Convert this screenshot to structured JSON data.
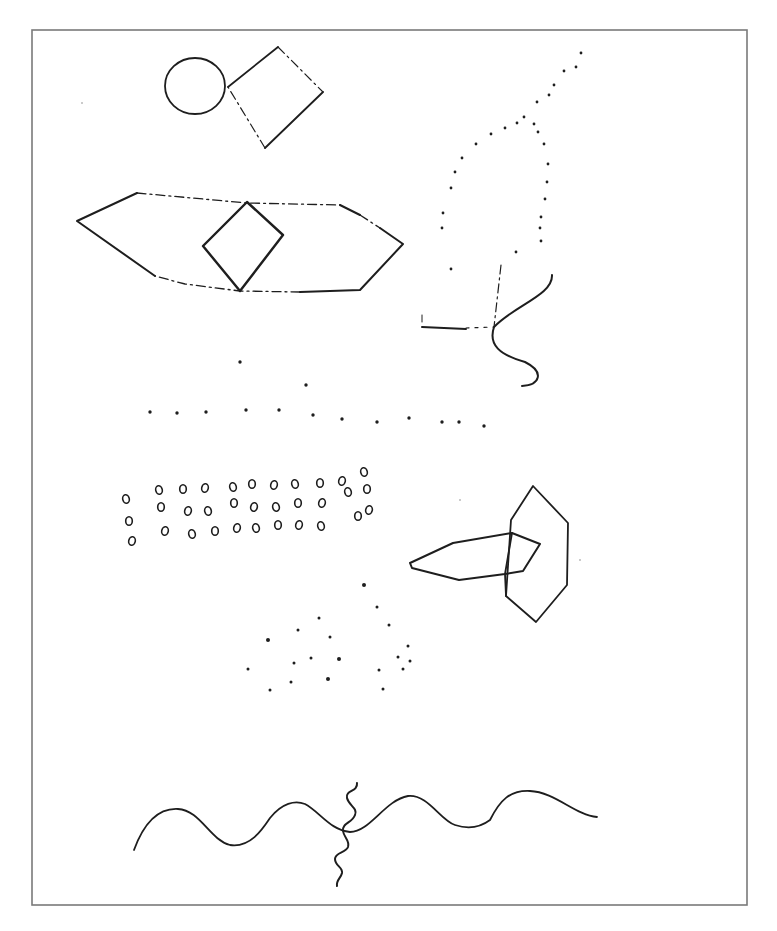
{
  "page": {
    "width": 777,
    "height": 931,
    "background": "#ffffff",
    "ink": "#1e1e1e",
    "frame_color": "#7a7a7a"
  },
  "frame": {
    "x": 32,
    "y": 30,
    "width": 715,
    "height": 875
  },
  "figures": {
    "circle": {
      "cx": 195,
      "cy": 86,
      "rx": 30,
      "ry": 28
    },
    "top_diamond": {
      "points": [
        [
          228,
          87
        ],
        [
          278,
          47
        ],
        [
          323,
          92
        ],
        [
          265,
          148
        ]
      ],
      "dashed_edges": [
        1,
        3
      ]
    },
    "hexagon": {
      "solid_paths": [
        [
          [
            155,
            276
          ],
          [
            77,
            221
          ],
          [
            137,
            193
          ]
        ],
        [
          [
            340,
            205
          ],
          [
            360,
            215
          ]
        ],
        [
          [
            380,
            228
          ],
          [
            403,
            244
          ],
          [
            360,
            290
          ],
          [
            300,
            292
          ]
        ]
      ],
      "dashed_paths": [
        [
          [
            137,
            193
          ],
          [
            247,
            203
          ],
          [
            340,
            205
          ]
        ],
        [
          [
            360,
            215
          ],
          [
            380,
            228
          ]
        ],
        [
          [
            300,
            292
          ],
          [
            240,
            291
          ],
          [
            185,
            284
          ],
          [
            155,
            276
          ]
        ]
      ]
    },
    "inner_diamond": {
      "points": [
        [
          247,
          202
        ],
        [
          283,
          235
        ],
        [
          240,
          291
        ],
        [
          203,
          246
        ]
      ]
    },
    "dotted_arch": {
      "dots": [
        [
          581,
          53
        ],
        [
          576,
          67
        ],
        [
          564,
          71
        ],
        [
          554,
          85
        ],
        [
          549,
          95
        ],
        [
          537,
          102
        ],
        [
          524,
          117
        ],
        [
          517,
          123
        ],
        [
          505,
          128
        ],
        [
          491,
          134
        ],
        [
          476,
          144
        ],
        [
          462,
          158
        ],
        [
          455,
          172
        ],
        [
          451,
          188
        ],
        [
          443,
          213
        ],
        [
          442,
          228
        ],
        [
          451,
          269
        ],
        [
          534,
          124
        ],
        [
          538,
          132
        ],
        [
          544,
          144
        ],
        [
          548,
          164
        ],
        [
          547,
          182
        ],
        [
          545,
          199
        ],
        [
          541,
          217
        ],
        [
          540,
          228
        ],
        [
          541,
          241
        ],
        [
          516,
          252
        ]
      ]
    },
    "corner_shape": {
      "vertical_dashed": [
        [
          501,
          265
        ],
        [
          494,
          327
        ]
      ],
      "horizontal_solid": [
        [
          422,
          327
        ],
        [
          466,
          329
        ]
      ],
      "horizontal_dashed": [
        [
          466,
          328
        ],
        [
          494,
          327
        ]
      ],
      "tick": [
        [
          422,
          315
        ],
        [
          422,
          322
        ]
      ],
      "s_curve": "M552,275 C553,295 515,305 494,327 C488,345 500,355 525,362 C545,372 540,385 522,386"
    },
    "dot_row": {
      "dots": [
        [
          240,
          362
        ],
        [
          306,
          385
        ],
        [
          150,
          412
        ],
        [
          177,
          413
        ],
        [
          206,
          412
        ],
        [
          246,
          410
        ],
        [
          279,
          410
        ],
        [
          313,
          415
        ],
        [
          342,
          419
        ],
        [
          377,
          422
        ],
        [
          409,
          418
        ],
        [
          442,
          422
        ],
        [
          459,
          422
        ],
        [
          484,
          426
        ]
      ]
    },
    "ring_grid": {
      "rings": [
        [
          126,
          499
        ],
        [
          129,
          521
        ],
        [
          132,
          541
        ],
        [
          159,
          490
        ],
        [
          183,
          489
        ],
        [
          205,
          488
        ],
        [
          233,
          487
        ],
        [
          252,
          484
        ],
        [
          274,
          485
        ],
        [
          295,
          484
        ],
        [
          320,
          483
        ],
        [
          342,
          481
        ],
        [
          364,
          472
        ],
        [
          161,
          507
        ],
        [
          188,
          511
        ],
        [
          208,
          511
        ],
        [
          234,
          503
        ],
        [
          254,
          507
        ],
        [
          276,
          507
        ],
        [
          298,
          503
        ],
        [
          322,
          503
        ],
        [
          348,
          492
        ],
        [
          367,
          489
        ],
        [
          165,
          531
        ],
        [
          192,
          534
        ],
        [
          215,
          531
        ],
        [
          237,
          528
        ],
        [
          256,
          528
        ],
        [
          278,
          525
        ],
        [
          299,
          525
        ],
        [
          321,
          526
        ],
        [
          358,
          516
        ],
        [
          369,
          510
        ]
      ]
    },
    "arrow_shape": {
      "points": [
        [
          410,
          563
        ],
        [
          453,
          543
        ],
        [
          512,
          533
        ],
        [
          540,
          544
        ],
        [
          523,
          571
        ],
        [
          505,
          574
        ],
        [
          459,
          580
        ],
        [
          412,
          568
        ]
      ]
    },
    "right_hexagon": {
      "points": [
        [
          511,
          520
        ],
        [
          533,
          486
        ],
        [
          568,
          523
        ],
        [
          567,
          585
        ],
        [
          536,
          622
        ],
        [
          506,
          596
        ]
      ],
      "inner_line": [
        [
          512,
          533
        ],
        [
          505,
          574
        ],
        [
          506,
          596
        ]
      ]
    },
    "scatter": {
      "dots": [
        [
          364,
          585
        ],
        [
          377,
          607
        ],
        [
          319,
          618
        ],
        [
          298,
          630
        ],
        [
          389,
          625
        ],
        [
          268,
          640
        ],
        [
          330,
          637
        ],
        [
          408,
          646
        ],
        [
          311,
          658
        ],
        [
          294,
          663
        ],
        [
          339,
          659
        ],
        [
          398,
          657
        ],
        [
          410,
          661
        ],
        [
          403,
          669
        ],
        [
          379,
          670
        ],
        [
          328,
          679
        ],
        [
          291,
          682
        ],
        [
          383,
          689
        ],
        [
          248,
          669
        ],
        [
          270,
          690
        ]
      ]
    },
    "wave": {
      "path": "M134,850 C145,820 160,808 178,809 C200,810 210,840 230,845 C250,848 262,830 270,818 C282,803 295,800 305,804 C320,812 330,830 350,832 C370,832 385,800 408,796 C428,794 440,820 455,825 C470,830 482,826 490,820 C500,800 510,790 530,791 C555,792 575,815 597,817"
    },
    "squiggle": {
      "path": "M357,783 C358,792 345,790 347,798 C349,806 358,808 355,815 C352,823 342,823 343,831 C344,838 350,840 348,847 C346,853 335,852 335,859 C335,866 343,867 342,873 C341,878 336,880 337,886"
    },
    "specks": [
      [
        82,
        103
      ],
      [
        580,
        560
      ],
      [
        460,
        500
      ]
    ]
  }
}
